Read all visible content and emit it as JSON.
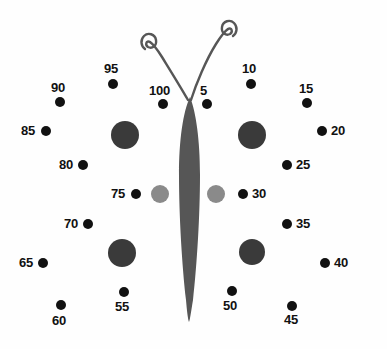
{
  "page": {
    "width": 387,
    "height": 349,
    "background_color": "#fefefe"
  },
  "colors": {
    "dot": "#111111",
    "label": "#111111",
    "body": "#565656",
    "antenna": "#565656",
    "wing_spot_dark": "#3a3a3a",
    "wing_spot_gray": "#8a8a8a"
  },
  "butterfly": {
    "body": {
      "name": "butterfly-body",
      "description": "tall narrow lens-shaped abdomen",
      "color": "#565656"
    },
    "antennae": [
      {
        "name": "antenna-left",
        "curl": "counter-clockwise spiral",
        "color": "#565656"
      },
      {
        "name": "antenna-right",
        "curl": "clockwise spiral",
        "color": "#565656"
      }
    ],
    "wing_spots": [
      {
        "name": "wing-spot-upper-left",
        "cx": 125,
        "cy": 135,
        "r": 14,
        "color": "#3a3a3a"
      },
      {
        "name": "wing-spot-upper-right",
        "cx": 252,
        "cy": 135,
        "r": 14,
        "color": "#3a3a3a"
      },
      {
        "name": "wing-spot-middle-left",
        "cx": 160,
        "cy": 194,
        "r": 9,
        "color": "#8a8a8a"
      },
      {
        "name": "wing-spot-middle-right",
        "cx": 216,
        "cy": 194,
        "r": 9,
        "color": "#8a8a8a"
      },
      {
        "name": "wing-spot-lower-left",
        "cx": 122,
        "cy": 253,
        "r": 14,
        "color": "#3a3a3a"
      },
      {
        "name": "wing-spot-lower-right",
        "cx": 252,
        "cy": 252,
        "r": 13,
        "color": "#3a3a3a"
      }
    ]
  },
  "dots": [
    {
      "number": "5",
      "cx": 207,
      "cy": 104,
      "r": 5,
      "label_x": 200,
      "label_y": 84
    },
    {
      "number": "10",
      "cx": 251,
      "cy": 84,
      "r": 5,
      "label_x": 242,
      "label_y": 62
    },
    {
      "number": "15",
      "cx": 307,
      "cy": 103,
      "r": 5,
      "label_x": 299,
      "label_y": 82
    },
    {
      "number": "20",
      "cx": 322,
      "cy": 131,
      "r": 5,
      "label_x": 331,
      "label_y": 124
    },
    {
      "number": "25",
      "cx": 287,
      "cy": 165,
      "r": 5,
      "label_x": 296,
      "label_y": 158
    },
    {
      "number": "30",
      "cx": 243,
      "cy": 194,
      "r": 5,
      "label_x": 252,
      "label_y": 187
    },
    {
      "number": "35",
      "cx": 287,
      "cy": 224,
      "r": 5,
      "label_x": 296,
      "label_y": 217
    },
    {
      "number": "40",
      "cx": 325,
      "cy": 263,
      "r": 5,
      "label_x": 334,
      "label_y": 256
    },
    {
      "number": "45",
      "cx": 292,
      "cy": 306,
      "r": 5,
      "label_x": 284,
      "label_y": 313
    },
    {
      "number": "50",
      "cx": 232,
      "cy": 291,
      "r": 5,
      "label_x": 223,
      "label_y": 299
    },
    {
      "number": "55",
      "cx": 124,
      "cy": 292,
      "r": 5,
      "label_x": 115,
      "label_y": 300
    },
    {
      "number": "60",
      "cx": 61,
      "cy": 305,
      "r": 5,
      "label_x": 52,
      "label_y": 314
    },
    {
      "number": "65",
      "cx": 43,
      "cy": 263,
      "r": 5,
      "label_x": 19,
      "label_y": 256
    },
    {
      "number": "70",
      "cx": 88,
      "cy": 224,
      "r": 5,
      "label_x": 64,
      "label_y": 217
    },
    {
      "number": "75",
      "cx": 136,
      "cy": 194,
      "r": 5,
      "label_x": 111,
      "label_y": 187
    },
    {
      "number": "80",
      "cx": 83,
      "cy": 165,
      "r": 5,
      "label_x": 59,
      "label_y": 158
    },
    {
      "number": "85",
      "cx": 46,
      "cy": 131,
      "r": 5,
      "label_x": 21,
      "label_y": 124
    },
    {
      "number": "90",
      "cx": 60,
      "cy": 102,
      "r": 5,
      "label_x": 51,
      "label_y": 81
    },
    {
      "number": "95",
      "cx": 113,
      "cy": 84,
      "r": 5,
      "label_x": 104,
      "label_y": 62
    },
    {
      "number": "100",
      "cx": 163,
      "cy": 104,
      "r": 5,
      "label_x": 149,
      "label_y": 84
    }
  ]
}
